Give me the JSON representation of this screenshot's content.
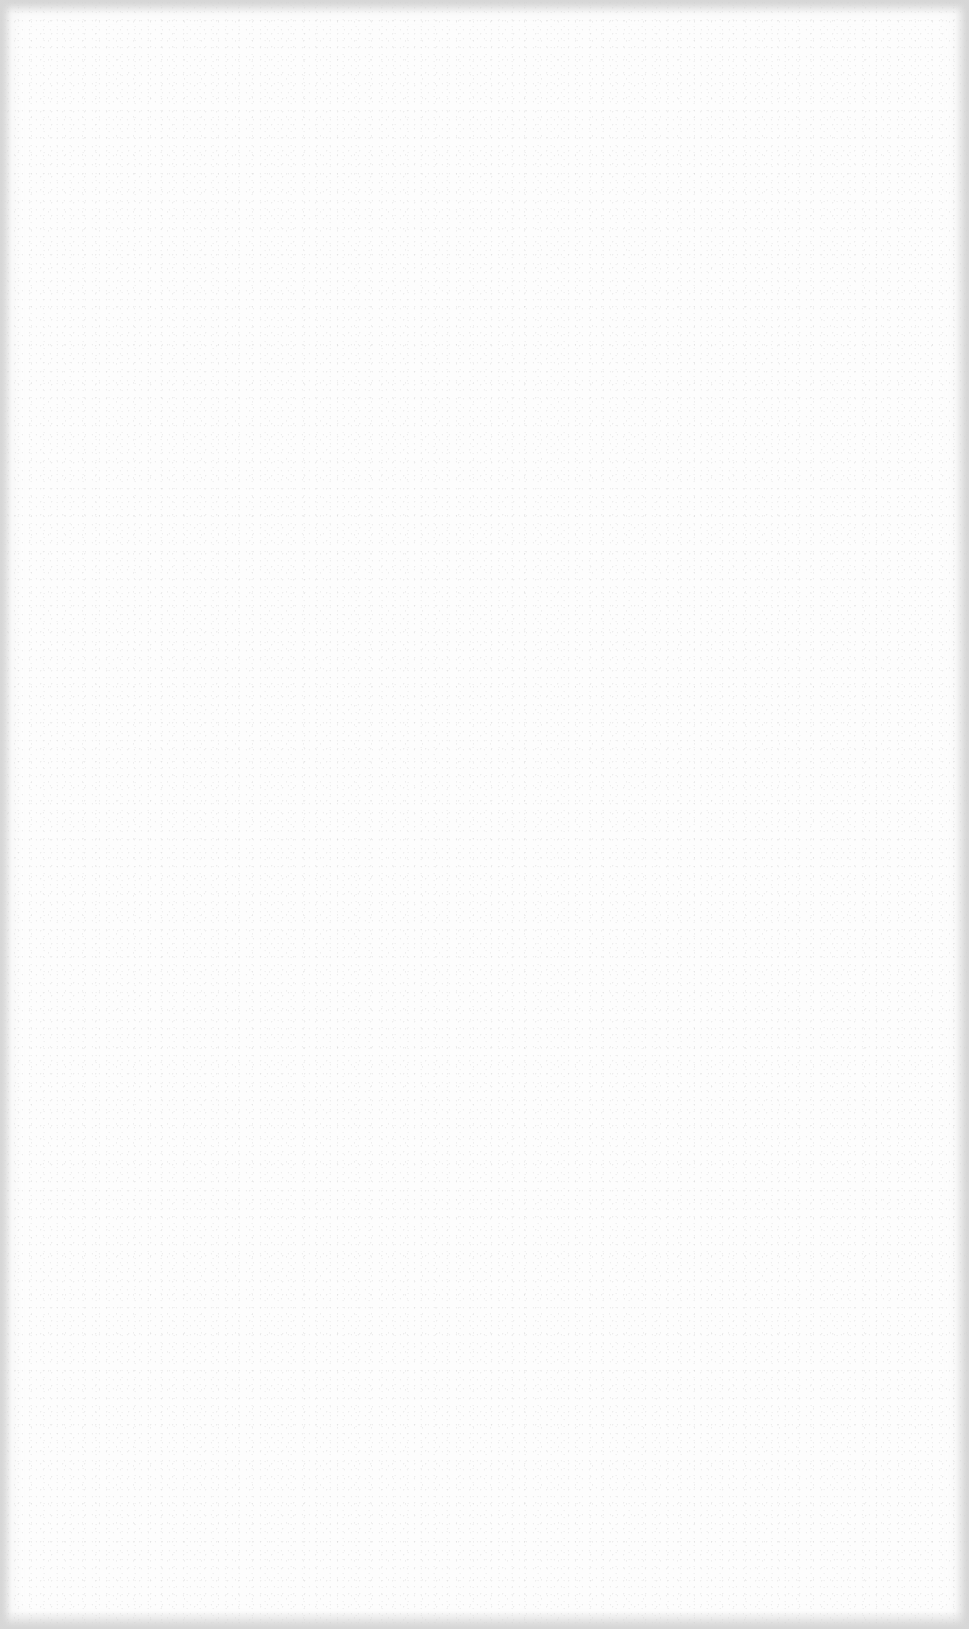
{
  "document": {
    "type": "blank-page",
    "page_content": "",
    "colors": {
      "paper": "#fdfdfd",
      "edge_shadow": "#d7d7d7",
      "grain": "#aaaaaa"
    }
  }
}
